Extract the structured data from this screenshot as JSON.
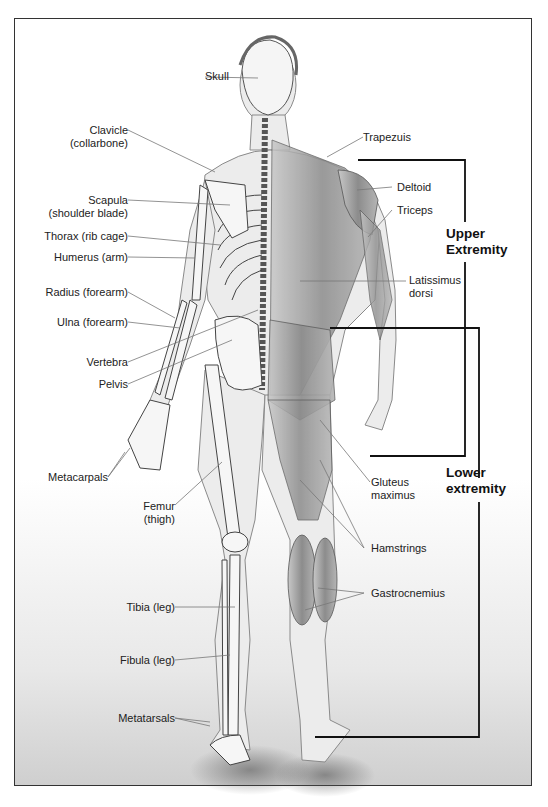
{
  "left_labels": [
    {
      "id": "skull",
      "lines": [
        "Skull"
      ]
    },
    {
      "id": "clavicle",
      "lines": [
        "Clavicle",
        "(collarbone)"
      ]
    },
    {
      "id": "scapula",
      "lines": [
        "Scapula",
        "(shoulder blade)"
      ]
    },
    {
      "id": "thorax",
      "lines": [
        "Thorax (rib cage)"
      ]
    },
    {
      "id": "humerus",
      "lines": [
        "Humerus (arm)"
      ]
    },
    {
      "id": "radius",
      "lines": [
        "Radius (forearm)"
      ]
    },
    {
      "id": "ulna",
      "lines": [
        "Ulna (forearm)"
      ]
    },
    {
      "id": "vertebra",
      "lines": [
        "Vertebra"
      ]
    },
    {
      "id": "pelvis",
      "lines": [
        "Pelvis"
      ]
    },
    {
      "id": "metacarpals",
      "lines": [
        "Metacarpals"
      ]
    },
    {
      "id": "femur",
      "lines": [
        "Femur",
        "(thigh)"
      ]
    },
    {
      "id": "tibia",
      "lines": [
        "Tibia (leg)"
      ]
    },
    {
      "id": "fibula",
      "lines": [
        "Fibula (leg)"
      ]
    },
    {
      "id": "metatarsals",
      "lines": [
        "Metatarsals"
      ]
    }
  ],
  "right_labels": [
    {
      "id": "trapezuis",
      "lines": [
        "Trapezuis"
      ]
    },
    {
      "id": "deltoid",
      "lines": [
        "Deltoid"
      ]
    },
    {
      "id": "triceps",
      "lines": [
        "Triceps"
      ]
    },
    {
      "id": "latissimus",
      "lines": [
        "Latissimus",
        "dorsi"
      ]
    },
    {
      "id": "gluteus",
      "lines": [
        "Gluteus",
        "maximus"
      ]
    },
    {
      "id": "hamstrings",
      "lines": [
        "Hamstrings"
      ]
    },
    {
      "id": "gastrocnemius",
      "lines": [
        "Gastrocnemius"
      ]
    }
  ],
  "regions": {
    "upper": [
      "Upper",
      "Extremity"
    ],
    "lower": [
      "Lower",
      "extremity"
    ]
  },
  "colors": {
    "frame": "#333333",
    "bracket": "#111111",
    "leader": "#777777",
    "bone_fill": "#f2f2f2",
    "muscle_fill": "#9a9a9a",
    "skin": "#e6e6e6"
  }
}
